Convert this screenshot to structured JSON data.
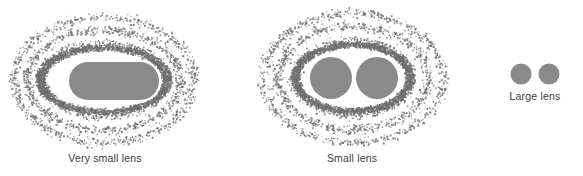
{
  "figure": {
    "type": "stipple-diagram",
    "background_color": "#ffffff",
    "width": 583,
    "height": 176,
    "solid_fill_color": "#8a8a8a",
    "stipple_dot_color": "#6e6e6e",
    "label_color": "#3b3b3b"
  },
  "panels": [
    {
      "id": "very-small-lens",
      "label": "Very small lens",
      "label_x": 105,
      "label_y": 152,
      "core_shape": "stadium",
      "core": {
        "cx": 114,
        "cy": 81,
        "rx": 45,
        "ry": 19,
        "round": 19
      },
      "rings": [
        {
          "rx": 62,
          "ry": 36,
          "band": 11,
          "density": 0.95
        },
        {
          "rx": 77,
          "ry": 50,
          "band": 10,
          "density": 0.8
        },
        {
          "rx": 90,
          "ry": 63,
          "band": 10,
          "density": 0.62
        }
      ],
      "center": {
        "cx": 104,
        "cy": 80
      }
    },
    {
      "id": "small-lens",
      "label": "Small lens",
      "label_x": 352,
      "label_y": 152,
      "core_shape": "double-circle",
      "cores": [
        {
          "cx": 331,
          "cy": 78,
          "r": 21
        },
        {
          "cx": 377,
          "cy": 78,
          "r": 21
        }
      ],
      "rings": [
        {
          "rx": 58,
          "ry": 37,
          "band": 12,
          "density": 0.95
        },
        {
          "rx": 75,
          "ry": 52,
          "band": 11,
          "density": 0.8
        },
        {
          "rx": 90,
          "ry": 65,
          "band": 10,
          "density": 0.6
        }
      ],
      "center": {
        "cx": 353,
        "cy": 78
      }
    },
    {
      "id": "large-lens",
      "label": "Large lens",
      "label_x": 535,
      "label_y": 90,
      "core_shape": "double-circle",
      "cores": [
        {
          "cx": 521,
          "cy": 74,
          "r": 10.5
        },
        {
          "cx": 549,
          "cy": 74,
          "r": 10.5
        }
      ],
      "rings": [],
      "center": {
        "cx": 535,
        "cy": 74
      }
    }
  ]
}
